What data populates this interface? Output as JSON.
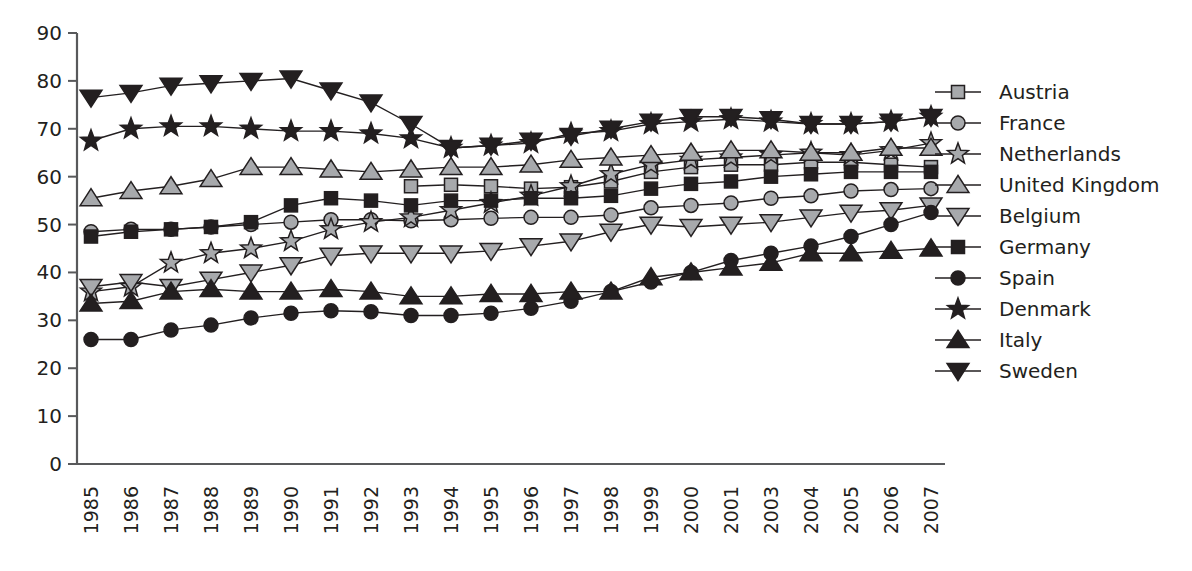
{
  "chart_data": {
    "type": "line",
    "title": "",
    "subtitle": "",
    "xlabel": "",
    "ylabel": "",
    "ylim": [
      0,
      90
    ],
    "ytick_step": 10,
    "grid": false,
    "legend_position": "right",
    "categories": [
      "1985",
      "1986",
      "1987",
      "1988",
      "1989",
      "1990",
      "1991",
      "1992",
      "1993",
      "1994",
      "1995",
      "1996",
      "1997",
      "1998",
      "1999",
      "2000",
      "2001",
      "2003",
      "2004",
      "2005",
      "2006",
      "2007"
    ],
    "yticks": [
      "0",
      "10",
      "20",
      "30",
      "40",
      "50",
      "60",
      "70",
      "80",
      "90"
    ],
    "series": [
      {
        "name": "Austria",
        "marker": "square",
        "fill": "#a7a9ac",
        "values": [
          null,
          null,
          null,
          null,
          null,
          null,
          null,
          null,
          58.0,
          58.3,
          58.0,
          57.5,
          57.8,
          59.0,
          61.0,
          62.0,
          62.5,
          62.5,
          63.0,
          63.0,
          62.5,
          62.0
        ]
      },
      {
        "name": "France",
        "marker": "circle",
        "fill": "#a7a9ac",
        "values": [
          48.5,
          49.0,
          49.0,
          49.5,
          50.0,
          50.5,
          51.0,
          51.0,
          50.8,
          51.0,
          51.3,
          51.5,
          51.5,
          52.0,
          53.5,
          54.0,
          54.5,
          55.5,
          56.0,
          57.0,
          57.3,
          57.5
        ]
      },
      {
        "name": "Netherlands",
        "marker": "star",
        "fill": "#a7a9ac",
        "values": [
          36.0,
          37.0,
          42.0,
          44.0,
          45.0,
          46.5,
          49.0,
          50.5,
          51.5,
          53.0,
          54.5,
          56.0,
          58.0,
          60.5,
          62.5,
          63.5,
          64.0,
          64.5,
          65.0,
          64.5,
          65.5,
          67.0
        ]
      },
      {
        "name": "United Kingdom",
        "marker": "triangle-up",
        "fill": "#a7a9ac",
        "values": [
          55.5,
          57.0,
          58.0,
          59.5,
          62.0,
          62.0,
          61.5,
          61.0,
          61.5,
          62.0,
          62.0,
          62.5,
          63.5,
          64.0,
          64.5,
          65.0,
          65.5,
          65.5,
          65.0,
          65.0,
          66.0,
          66.0
        ]
      },
      {
        "name": "Belgium",
        "marker": "triangle-down",
        "fill": "#a7a9ac",
        "values": [
          37.0,
          38.0,
          37.0,
          38.5,
          40.0,
          41.5,
          43.5,
          44.0,
          44.0,
          44.0,
          44.5,
          45.5,
          46.5,
          48.5,
          50.0,
          49.5,
          50.0,
          50.5,
          51.5,
          52.5,
          53.0,
          54.0
        ]
      },
      {
        "name": "Germany",
        "marker": "square",
        "fill": "#231f20",
        "values": [
          47.5,
          48.5,
          49.0,
          49.5,
          50.5,
          54.0,
          55.5,
          55.0,
          54.0,
          55.0,
          55.0,
          55.5,
          55.5,
          56.0,
          57.5,
          58.5,
          59.0,
          60.0,
          60.5,
          61.0,
          61.0,
          61.0
        ]
      },
      {
        "name": "Spain",
        "marker": "circle",
        "fill": "#231f20",
        "values": [
          26.0,
          26.0,
          28.0,
          29.0,
          30.5,
          31.5,
          32.0,
          31.8,
          31.0,
          31.0,
          31.5,
          32.5,
          34.0,
          36.0,
          38.0,
          40.0,
          42.5,
          44.0,
          45.5,
          47.5,
          50.0,
          52.5
        ]
      },
      {
        "name": "Denmark",
        "marker": "star",
        "fill": "#231f20",
        "values": [
          67.5,
          70.0,
          70.5,
          70.5,
          70.0,
          69.5,
          69.5,
          69.0,
          68.0,
          66.0,
          66.5,
          67.0,
          69.0,
          69.5,
          71.0,
          71.5,
          72.0,
          71.5,
          71.0,
          71.0,
          71.5,
          72.5
        ]
      },
      {
        "name": "Italy",
        "marker": "triangle-up",
        "fill": "#231f20",
        "values": [
          33.5,
          34.0,
          36.0,
          36.5,
          36.0,
          36.0,
          36.5,
          36.0,
          35.0,
          35.0,
          35.5,
          35.5,
          36.0,
          36.0,
          39.0,
          40.0,
          41.0,
          42.0,
          44.0,
          44.0,
          44.5,
          45.0
        ]
      },
      {
        "name": "Sweden",
        "marker": "triangle-down",
        "fill": "#231f20",
        "values": [
          76.5,
          77.5,
          79.0,
          79.5,
          80.0,
          80.5,
          78.0,
          75.5,
          71.0,
          66.0,
          66.5,
          67.5,
          68.5,
          70.0,
          71.5,
          72.5,
          72.5,
          72.0,
          71.0,
          71.0,
          71.5,
          72.5
        ]
      }
    ]
  },
  "legend": {
    "entries": [
      {
        "label": "Austria"
      },
      {
        "label": "France"
      },
      {
        "label": "Netherlands"
      },
      {
        "label": "United Kingdom"
      },
      {
        "label": "Belgium"
      },
      {
        "label": "Germany"
      },
      {
        "label": "Spain"
      },
      {
        "label": "Denmark"
      },
      {
        "label": "Italy"
      },
      {
        "label": "Sweden"
      }
    ]
  },
  "colors": {
    "gray_marker": "#a7a9ac",
    "black_marker": "#231f20",
    "axis": "#58595b",
    "line": "#231f20",
    "background": "#ffffff"
  }
}
